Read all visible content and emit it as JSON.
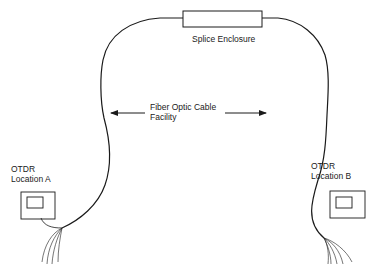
{
  "diagram": {
    "type": "fiber-optic-otdr-setup",
    "colors": {
      "line": "#1a1a1a",
      "background": "#ffffff"
    },
    "labels": {
      "splice_enclosure": "Splice Enclosure",
      "cable_facility_line1": "Fiber Optic Cable",
      "cable_facility_line2": "Facility",
      "otdr_a_line1": "OTDR",
      "otdr_a_line2": "Location A",
      "otdr_b_line1": "OTDR",
      "otdr_b_line2": "Location B"
    },
    "nodes": [
      {
        "id": "splice-enclosure",
        "label": "Splice Enclosure",
        "shape": "rectangle"
      },
      {
        "id": "otdr-a",
        "label": "OTDR Location A",
        "shape": "instrument-box"
      },
      {
        "id": "otdr-b",
        "label": "OTDR Location B",
        "shape": "instrument-box"
      }
    ],
    "edges": [
      {
        "from": "otdr-a",
        "to": "splice-enclosure",
        "label": "Fiber Optic Cable Facility"
      },
      {
        "from": "splice-enclosure",
        "to": "otdr-b",
        "label": "Fiber Optic Cable Facility"
      }
    ]
  }
}
